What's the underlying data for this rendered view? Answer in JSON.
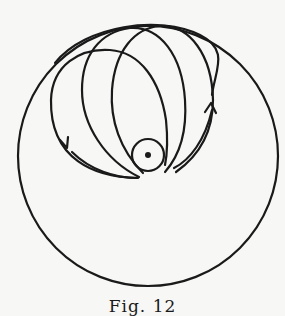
{
  "figure": {
    "caption": "Fig. 12",
    "stroke_color": "#1a1a1a",
    "background": "#f7f7f5",
    "outer_circle": {
      "cx": 148,
      "cy": 156,
      "r": 131
    },
    "inner_circle": {
      "cx": 148,
      "cy": 155,
      "r": 16
    },
    "center_dot": {
      "cx": 148,
      "cy": 155,
      "r": 3
    },
    "orbits": [
      {
        "d": "M 137 177 C 90 176, 40 160, 45 90 C 50 45, 120 40, 150 70 C 168 95, 170 130, 167 155"
      },
      {
        "d": "M 140 176 C 100 165, 78 125, 82 80 C 86 35, 140 18, 170 45 C 188 70, 185 120, 164 170"
      },
      {
        "d": "M 145 171 C 115 150, 108 110, 115 70 C 125 25, 178 15, 200 45 C 215 70, 212 110, 173 168"
      },
      {
        "d": "M 53 67 C 70 30, 150 15, 195 50 C 215 80, 230 100, 172 176"
      }
    ],
    "arrows": [
      {
        "name": "left-arrow",
        "x": 67,
        "y": 147,
        "direction": "down"
      },
      {
        "name": "right-arrow",
        "x": 211,
        "y": 106,
        "direction": "up"
      }
    ]
  }
}
